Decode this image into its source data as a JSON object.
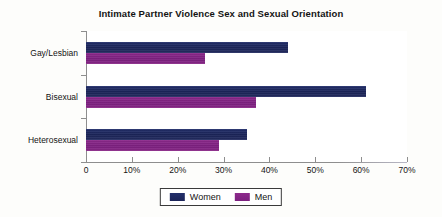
{
  "chart_data": {
    "type": "bar",
    "orientation": "horizontal",
    "title": "Intimate Partner Violence Sex and Sexual Orientation",
    "xlabel": "",
    "ylabel": "",
    "categories": [
      "Gay/Lesbian",
      "Bisexual",
      "Heterosexual"
    ],
    "series": [
      {
        "name": "Women",
        "color": "#1f2a63",
        "values": [
          44,
          61,
          35
        ]
      },
      {
        "name": "Men",
        "color": "#8a2586",
        "values": [
          26,
          37,
          29
        ]
      }
    ],
    "xlim": [
      0,
      70
    ],
    "xticks": [
      0,
      10,
      20,
      30,
      40,
      50,
      60,
      70
    ],
    "xtick_labels": [
      "0",
      "10%",
      "20%",
      "30%",
      "40%",
      "50%",
      "60%",
      "70%"
    ],
    "grid": false,
    "legend_position": "bottom",
    "value_unit": "%"
  },
  "legend": {
    "entries": [
      {
        "label": "Women",
        "swatch": "women-color-swatch"
      },
      {
        "label": "Men",
        "swatch": "men-color-swatch"
      }
    ]
  }
}
